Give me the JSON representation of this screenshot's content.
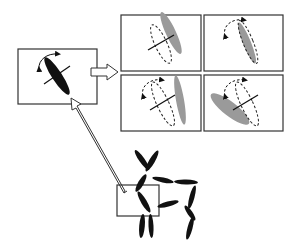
{
  "diagram": {
    "colors": {
      "stroke": "#333333",
      "segment_primary": "#111111",
      "segment_variant": "#9a9a9a",
      "background": "#ffffff"
    },
    "source_panel": {
      "label": "selected-segment",
      "segment_fill": "black",
      "has_rotation_arrow": true,
      "has_axis_cross": true
    },
    "variant_panels": [
      {
        "id": "variant-1",
        "rotation": "tilt-right",
        "has_rotation_arrow": false,
        "has_axis_cross": true
      },
      {
        "id": "variant-2",
        "rotation": "twist-about-long-axis",
        "has_rotation_arrow": true,
        "has_axis_cross": false
      },
      {
        "id": "variant-3",
        "rotation": "tilt-right-with-twist",
        "has_rotation_arrow": true,
        "has_axis_cross": true
      },
      {
        "id": "variant-4",
        "rotation": "tilt-left-with-twist",
        "has_rotation_arrow": true,
        "has_axis_cross": true
      }
    ],
    "figure": {
      "type": "articulated-stick-figure",
      "segment_count": 12,
      "highlighted_joint_box": true
    },
    "arrows": [
      {
        "id": "source-to-variants",
        "direction": "right"
      },
      {
        "id": "figure-to-source",
        "direction": "up-left"
      }
    ]
  }
}
